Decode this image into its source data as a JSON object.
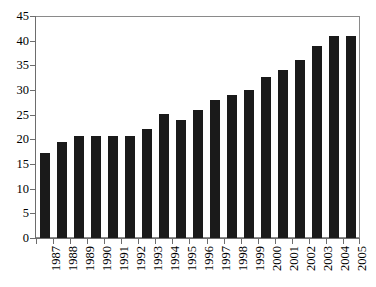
{
  "chart_data": {
    "type": "bar",
    "title": "",
    "subtitle": "",
    "xlabel": "",
    "ylabel": "",
    "categories": [
      "1987",
      "1988",
      "1989",
      "1990",
      "1991",
      "1992",
      "1993",
      "1994",
      "1995",
      "1996",
      "1997",
      "1998",
      "1999",
      "2000",
      "2001",
      "2002",
      "2003",
      "2004",
      "2005"
    ],
    "values": [
      17.3,
      19.4,
      20.7,
      20.6,
      20.6,
      20.7,
      22.0,
      25.1,
      23.9,
      25.9,
      28.0,
      29.0,
      30.1,
      32.7,
      34.0,
      36.1,
      39.0,
      41.0,
      41.0
    ],
    "series": [
      {
        "name": "",
        "values": [
          17.3,
          19.4,
          20.7,
          20.6,
          20.6,
          20.7,
          22.0,
          25.1,
          23.9,
          25.9,
          28.0,
          29.0,
          30.1,
          32.7,
          34.0,
          36.1,
          39.0,
          41.0,
          41.0
        ]
      }
    ],
    "ylim": [
      0,
      45
    ],
    "yticks": [
      0,
      5,
      10,
      15,
      20,
      25,
      30,
      35,
      40,
      45
    ],
    "ytick_labels": [
      "0",
      "5",
      "10",
      "15",
      "20",
      "25",
      "30",
      "35",
      "40",
      "45"
    ],
    "grid": "horizontal",
    "legend": "none",
    "annotations": [],
    "colors": {
      "bar": "#1a1a1a",
      "grid": "#9a9a9a",
      "axis": "#6d6d6d",
      "frame": "#8a8a8a",
      "background": "#ffffff",
      "text": "#000000"
    },
    "xtick_label_rotation": 90
  }
}
